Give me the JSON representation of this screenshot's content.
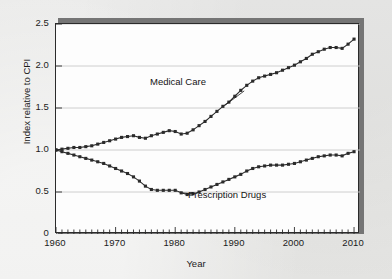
{
  "chart_data": {
    "type": "line",
    "title": "",
    "xlabel": "Year",
    "ylabel": "Index relative to CPI",
    "xlim": [
      1960,
      2011
    ],
    "ylim": [
      0,
      2.5
    ],
    "grid": "horizontal",
    "legend_position": "inline-annotations",
    "xticks": [
      "1960",
      "1970",
      "1980",
      "1990",
      "2000",
      "2010"
    ],
    "xtick_values": [
      1960,
      1970,
      1980,
      1990,
      2000,
      2010
    ],
    "xminor_tick_interval": 1,
    "yticks": [
      "0",
      "0.5",
      "1.0",
      "1.5",
      "2.0",
      "2.5"
    ],
    "ytick_values": [
      0,
      0.5,
      1.0,
      1.5,
      2.0,
      2.5
    ],
    "annotations": [
      {
        "text": "Medical Care",
        "series": "Medical Care"
      },
      {
        "text": "Prescription Drugs",
        "series": "Prescription Drugs"
      }
    ],
    "series": [
      {
        "name": "Medical Care",
        "marker": "square",
        "x": [
          1960,
          1961,
          1962,
          1963,
          1964,
          1965,
          1966,
          1967,
          1968,
          1969,
          1970,
          1971,
          1972,
          1973,
          1974,
          1975,
          1976,
          1977,
          1978,
          1979,
          1980,
          1981,
          1982,
          1983,
          1984,
          1985,
          1986,
          1987,
          1988,
          1989,
          1990,
          1991,
          1992,
          1993,
          1994,
          1995,
          1996,
          1997,
          1998,
          1999,
          2000,
          2001,
          2002,
          2003,
          2004,
          2005,
          2006,
          2007,
          2008,
          2009,
          2010
        ],
        "values": [
          1.0,
          1.01,
          1.02,
          1.03,
          1.03,
          1.04,
          1.05,
          1.07,
          1.09,
          1.11,
          1.13,
          1.15,
          1.16,
          1.17,
          1.15,
          1.14,
          1.17,
          1.19,
          1.21,
          1.23,
          1.22,
          1.19,
          1.2,
          1.24,
          1.29,
          1.34,
          1.4,
          1.46,
          1.52,
          1.57,
          1.64,
          1.71,
          1.77,
          1.82,
          1.86,
          1.88,
          1.9,
          1.92,
          1.95,
          1.98,
          2.01,
          2.05,
          2.09,
          2.14,
          2.17,
          2.2,
          2.22,
          2.22,
          2.21,
          2.26,
          2.32
        ]
      },
      {
        "name": "Prescription Drugs",
        "marker": "square",
        "x": [
          1960,
          1961,
          1962,
          1963,
          1964,
          1965,
          1966,
          1967,
          1968,
          1969,
          1970,
          1971,
          1972,
          1973,
          1974,
          1975,
          1976,
          1977,
          1978,
          1979,
          1980,
          1981,
          1982,
          1983,
          1984,
          1985,
          1986,
          1987,
          1988,
          1989,
          1990,
          1991,
          1992,
          1993,
          1994,
          1995,
          1996,
          1997,
          1998,
          1999,
          2000,
          2001,
          2002,
          2003,
          2004,
          2005,
          2006,
          2007,
          2008,
          2009,
          2010
        ],
        "values": [
          1.0,
          0.98,
          0.96,
          0.94,
          0.92,
          0.9,
          0.88,
          0.86,
          0.84,
          0.81,
          0.78,
          0.75,
          0.72,
          0.68,
          0.63,
          0.57,
          0.53,
          0.52,
          0.52,
          0.52,
          0.52,
          0.49,
          0.47,
          0.48,
          0.5,
          0.53,
          0.56,
          0.59,
          0.62,
          0.65,
          0.68,
          0.71,
          0.75,
          0.78,
          0.8,
          0.81,
          0.82,
          0.82,
          0.82,
          0.83,
          0.84,
          0.86,
          0.88,
          0.9,
          0.92,
          0.93,
          0.94,
          0.94,
          0.93,
          0.96,
          0.98
        ]
      }
    ]
  },
  "colors": {
    "series_line": "#2b2b2b",
    "grid": "#c8c8c8",
    "axis": "#2b2b2b",
    "plot_background": "#fdfdfd",
    "page_background": "#e9e9e7",
    "shadow": "#757575"
  }
}
